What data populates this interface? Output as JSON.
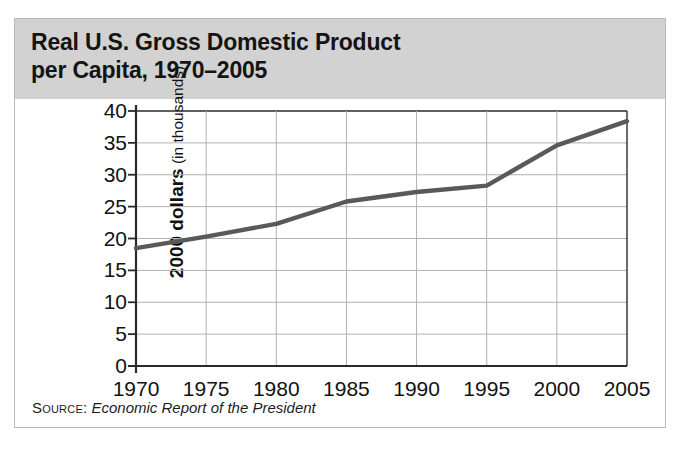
{
  "title": "Real U.S. Gross Domestic Product\nper Capita, 1970–2005",
  "source": {
    "label": "Source:",
    "text": "Economic Report of the President"
  },
  "axis": {
    "y_title_strong": "2000 dollars",
    "y_title_light": " (in thousands)"
  },
  "colors": {
    "header_band": "#d2d2d2",
    "line": "#595959",
    "grid": "#b0b0b0",
    "axis": "#2a2a2a",
    "card_border": "#b9b9b9"
  },
  "chart_data": {
    "type": "line",
    "title": "Real U.S. Gross Domestic Product per Capita, 1970–2005",
    "xlabel": "",
    "ylabel": "2000 dollars (in thousands)",
    "xlim": [
      1970,
      2005
    ],
    "ylim": [
      0,
      40
    ],
    "grid": true,
    "legend": "none",
    "xticks": [
      1970,
      1975,
      1980,
      1985,
      1990,
      1995,
      2000,
      2005
    ],
    "yticks": [
      0,
      5,
      10,
      15,
      20,
      25,
      30,
      35,
      40
    ],
    "x": [
      1970,
      1975,
      1980,
      1985,
      1990,
      1995,
      2000,
      2005
    ],
    "values": [
      18.5,
      20.3,
      22.3,
      25.8,
      27.3,
      28.3,
      34.6,
      38.4
    ],
    "series": [
      {
        "name": "Real GDP per capita",
        "values": [
          18.5,
          20.3,
          22.3,
          25.8,
          27.3,
          28.3,
          34.6,
          38.4
        ]
      }
    ]
  }
}
